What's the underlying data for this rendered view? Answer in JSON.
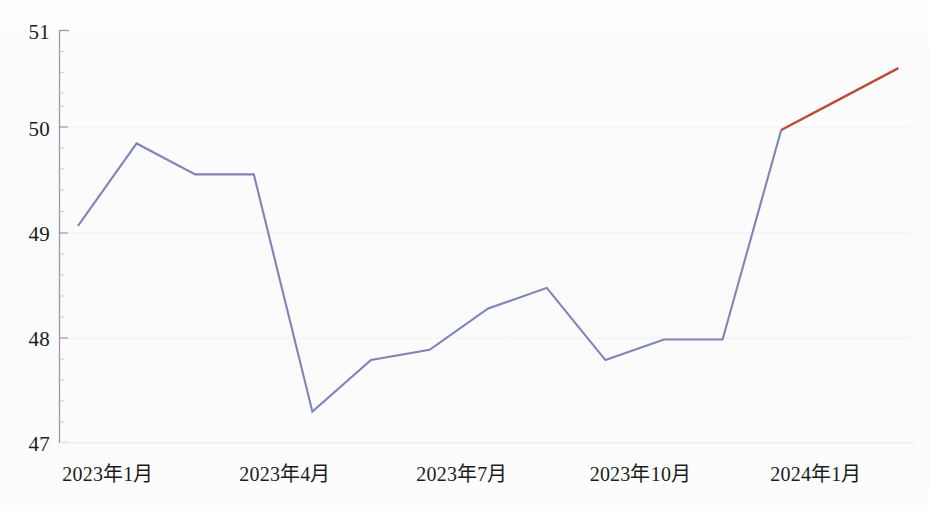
{
  "chart_data": {
    "type": "line",
    "title": "",
    "subtitle": "",
    "xlabel": "",
    "ylabel": "",
    "grid": false,
    "legend_position": "none",
    "ylim": [
      47,
      51
    ],
    "ytick_labels": [
      "51",
      "50",
      "49",
      "48",
      "47"
    ],
    "ytick_values": [
      51,
      50,
      49,
      48,
      47
    ],
    "yminor_step": 0.2,
    "xtick_labels": [
      "2023年1月",
      "2023年4月",
      "2023年7月",
      "2023年10月",
      "2024年1月"
    ],
    "xtick_indices": [
      0,
      3,
      6,
      9,
      12
    ],
    "categories": [
      "2023年1月",
      "2023年2月",
      "2023年3月",
      "2023年4月",
      "2023年5月",
      "2023年6月",
      "2023年7月",
      "2023年8月",
      "2023年9月",
      "2023年10月",
      "2023年11月",
      "2023年12月",
      "2024年1月",
      "2024年2月",
      "2024年3月"
    ],
    "series": [
      {
        "name": "实际值",
        "color": "#7f84b8",
        "values": [
          49.1,
          49.9,
          49.6,
          49.6,
          47.3,
          47.8,
          47.9,
          48.3,
          48.5,
          47.8,
          48.0,
          48.0,
          50.03,
          null,
          null
        ]
      },
      {
        "name": "预测值",
        "color": "#be4a37",
        "values": [
          null,
          null,
          null,
          null,
          null,
          null,
          null,
          null,
          null,
          null,
          null,
          null,
          50.03,
          50.33,
          50.63
        ]
      }
    ],
    "annotations": []
  },
  "axis": {
    "y_axis_name": "y-axis",
    "x_axis_name": "x-axis",
    "axis_color": "#8a8a96"
  }
}
